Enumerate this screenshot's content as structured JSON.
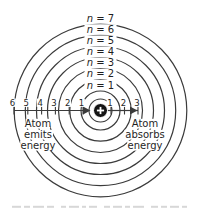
{
  "figure": {
    "background": "#ffffff",
    "line_color": "#3b3b3b",
    "text_color": "#1f1f1f",
    "center": {
      "x": 100.5,
      "y": 110.5
    },
    "nucleus": {
      "symbol": "+",
      "dot_radius": 7,
      "ring_radius": 11.5,
      "dot_color": "#141414",
      "symbol_color": "#ffffff"
    },
    "levels": [
      {
        "n": 1,
        "label": "n = 1",
        "radius": 19.5
      },
      {
        "n": 2,
        "label": "n = 2",
        "radius": 30.7
      },
      {
        "n": 3,
        "label": "n = 3",
        "radius": 42.0
      },
      {
        "n": 4,
        "label": "n = 4",
        "radius": 53.0
      },
      {
        "n": 5,
        "label": "n = 5",
        "radius": 64.0
      },
      {
        "n": 6,
        "label": "n = 6",
        "radius": 75.2
      },
      {
        "n": 7,
        "label": "n = 7",
        "radius": 86.3
      }
    ],
    "left_scale": {
      "tick_labels": [
        "6",
        "5",
        "4",
        "3",
        "2",
        "1"
      ],
      "x_start": 14,
      "x_end": 83,
      "arrow_tip_x": 90.5,
      "direction": "toward-nucleus",
      "annotation": {
        "lines": [
          "Atom",
          "emits",
          "energy"
        ],
        "center_x": 38,
        "first_baseline_y": 127,
        "line_height": 11
      }
    },
    "right_scale": {
      "tick_labels": [
        "1",
        "2",
        "3"
      ],
      "x_start": 108,
      "x_end": 138,
      "arrow_tip_x": 137.5,
      "direction": "away-from-nucleus",
      "annotation": {
        "lines": [
          "Atom",
          "absorbs",
          "energy"
        ],
        "center_x": 145,
        "first_baseline_y": 127,
        "line_height": 11
      }
    },
    "tick_label_baseline_y": 105.5,
    "axis_y": 110.5
  }
}
